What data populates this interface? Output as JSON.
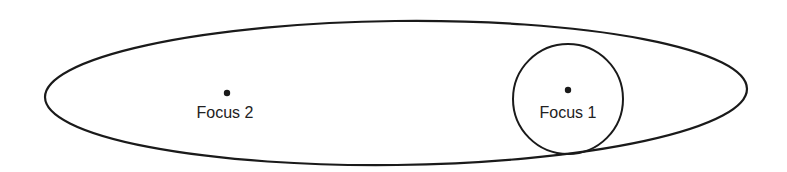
{
  "diagram": {
    "type": "ellipse-foci",
    "colors": {
      "stroke": "#1a1a1a",
      "background": "#ffffff",
      "text": "#222222"
    },
    "ellipse": {
      "cx": 396,
      "cy": 93,
      "rx": 351,
      "ry": 72,
      "rotation_deg": -0.7
    },
    "circle": {
      "cx": 568,
      "cy": 99,
      "r": 55
    },
    "foci": [
      {
        "label": "Focus 2",
        "x": 227,
        "y": 93
      },
      {
        "label": "Focus 1",
        "x": 568,
        "y": 90
      }
    ]
  }
}
